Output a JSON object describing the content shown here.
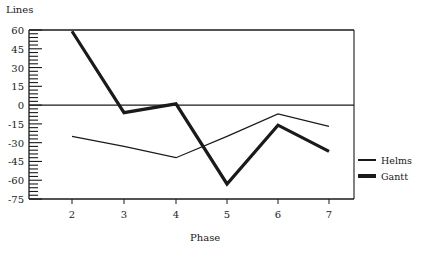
{
  "chart_data": {
    "type": "line",
    "title": "",
    "xlabel": "Phase",
    "ylabel": "Lines",
    "categories": [
      2,
      3,
      4,
      5,
      6,
      7
    ],
    "series": [
      {
        "name": "Helms",
        "style": "thin",
        "values": [
          -25,
          -33,
          -42,
          -25,
          -7,
          -17
        ]
      },
      {
        "name": "Gantt",
        "style": "thick",
        "values": [
          59,
          -6,
          1,
          -63,
          -16,
          -37
        ]
      }
    ],
    "ylim": [
      -75,
      60
    ],
    "yticks": [
      60,
      45,
      30,
      15,
      0,
      -15,
      -30,
      -45,
      -60,
      -75
    ],
    "xticks": [
      2,
      3,
      4,
      5,
      6,
      7
    ],
    "grid": false,
    "zero_line": true,
    "legend_position": "right"
  },
  "labels": {
    "ylabel": "Lines",
    "xlabel": "Phase",
    "legend": [
      "Helms",
      "Gantt"
    ]
  }
}
